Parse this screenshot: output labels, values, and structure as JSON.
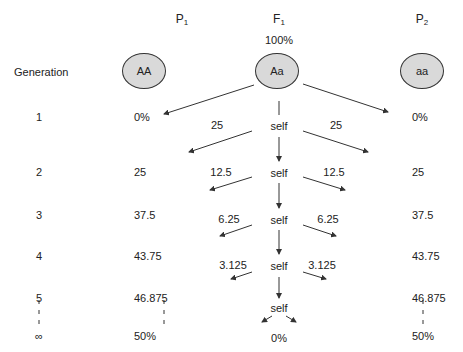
{
  "headers": {
    "p1": {
      "main": "P",
      "sub": "1"
    },
    "f1": {
      "main": "F",
      "sub": "1"
    },
    "p2": {
      "main": "P",
      "sub": "2"
    },
    "f1_percent": "100%",
    "generation_label": "Generation"
  },
  "nodes": {
    "p1": "AA",
    "f1": "Aa",
    "p2": "aa"
  },
  "generations": [
    "1",
    "2",
    "3",
    "4",
    "5",
    "∞"
  ],
  "p1_column": [
    "0%",
    "25",
    "37.5",
    "43.75",
    "46.875",
    "50%"
  ],
  "p2_column": [
    "0%",
    "25",
    "37.5",
    "43.75",
    "46.875",
    "50%"
  ],
  "center": {
    "self_labels": [
      "self",
      "self",
      "self",
      "self",
      "self"
    ],
    "branch_left": [
      "25",
      "12.5",
      "6.25",
      "3.125"
    ],
    "branch_right": [
      "25",
      "12.5",
      "6.25",
      "3.125"
    ],
    "final": "0%"
  },
  "colors": {
    "node_fill": "#d9d9d9",
    "line": "#333333"
  }
}
